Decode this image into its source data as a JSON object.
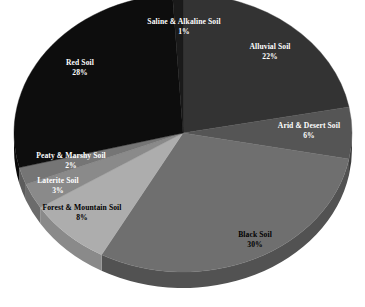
{
  "chart_data": {
    "type": "pie",
    "title": "",
    "subtitle": "",
    "xlabel": "",
    "ylabel": "",
    "legend_position": "none",
    "grid": false,
    "three_d": true,
    "units": "percent",
    "total": 100,
    "categories": [
      "Alluvial Soil",
      "Arid & Desert Soil",
      "Black Soil",
      "Forest & Mountain Soil",
      "Laterite Soil",
      "Peaty & Marshy Soil",
      "Red Soil",
      "Saline & Alkaline Soil"
    ],
    "values": [
      22,
      6,
      30,
      8,
      3,
      2,
      28,
      1
    ],
    "slices": [
      {
        "name": "Alluvial Soil",
        "value": 22,
        "percent_label": "22%",
        "color": "#333333",
        "side_color": "#242424",
        "label_color": "#ffffff",
        "label_x": 270,
        "label_y": 52
      },
      {
        "name": "Arid & Desert Soil",
        "value": 6,
        "percent_label": "6%",
        "color": "#555555",
        "side_color": "#3d3d3d",
        "label_color": "#ffffff",
        "label_x": 309,
        "label_y": 131
      },
      {
        "name": "Black Soil",
        "value": 30,
        "percent_label": "30%",
        "color": "#6f6f6f",
        "side_color": "#525252",
        "label_color": "#000000",
        "label_x": 255,
        "label_y": 240
      },
      {
        "name": "Forest & Mountain Soil",
        "value": 8,
        "percent_label": "8%",
        "color": "#adadad",
        "side_color": "#8a8a8a",
        "label_color": "#000000",
        "label_x": 82,
        "label_y": 213
      },
      {
        "name": "Laterite Soil",
        "value": 3,
        "percent_label": "3%",
        "color": "#8a8a8a",
        "side_color": "#6b6b6b",
        "label_color": "#ffffff",
        "label_x": 58,
        "label_y": 186
      },
      {
        "name": "Peaty & Marshy Soil",
        "value": 2,
        "percent_label": "2%",
        "color": "#757575",
        "side_color": "#5c5c5c",
        "label_color": "#ffffff",
        "label_x": 71,
        "label_y": 161
      },
      {
        "name": "Red Soil",
        "value": 28,
        "percent_label": "28%",
        "color": "#0d0d0d",
        "side_color": "#090909",
        "label_color": "#ffffff",
        "label_x": 80,
        "label_y": 68
      },
      {
        "name": "Saline & Alkaline Soil",
        "value": 1,
        "percent_label": "1%",
        "color": "#1a1a1a",
        "side_color": "#111111",
        "label_color": "#ffffff",
        "label_x": 184,
        "label_y": 27
      }
    ],
    "background_color": "#ffffff",
    "geometry": {
      "center_x": 183,
      "center_y": 133,
      "radius_x": 169,
      "radius_y": 139,
      "depth": 16,
      "start_angle_deg": -90
    }
  }
}
